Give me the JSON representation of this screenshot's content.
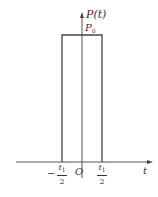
{
  "diagram": {
    "type": "rectangular-pulse",
    "y_axis_label": "P(t)",
    "amplitude_label": "P",
    "amplitude_subscript": "0",
    "x_axis_label": "t",
    "origin_label": "O",
    "left_edge": {
      "sign": "−",
      "numerator": "t",
      "numerator_subscript": "1",
      "denominator": "2"
    },
    "right_edge": {
      "numerator": "t",
      "numerator_subscript": "1",
      "denominator": "2"
    },
    "colors": {
      "line": "#444444",
      "text": "#333333",
      "background": "#ffffff"
    }
  }
}
